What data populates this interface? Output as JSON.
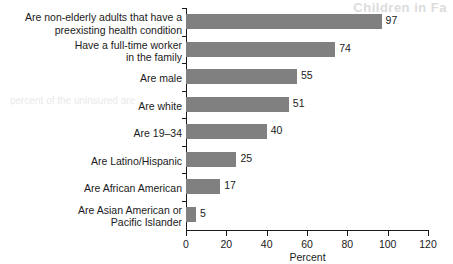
{
  "chart_data": {
    "type": "bar",
    "orientation": "horizontal",
    "title": "",
    "xlabel": "Percent",
    "ylabel": "",
    "xlim": [
      0,
      120
    ],
    "xticks": [
      0,
      20,
      40,
      60,
      80,
      100,
      120
    ],
    "grid": false,
    "legend": null,
    "bar_color": "#808080",
    "axis_color": "#1a1a1a",
    "categories": [
      "Are non-elderly adults that have a\npreexisting health condition",
      "Have a full-time worker\nin the family",
      "Are male",
      "Are white",
      "Are 19–34",
      "Are Latino/Hispanic",
      "Are African American",
      "Are Asian American or\nPacific Islander"
    ],
    "values": [
      97,
      74,
      55,
      51,
      40,
      25,
      17,
      5
    ],
    "value_labels": [
      "97",
      "74",
      "55",
      "51",
      "40",
      "25",
      "17",
      "5"
    ]
  },
  "artifacts": {
    "top_right_bleed": "Children in Fa",
    "mid_left_bleed": "percent of the uninsured are"
  }
}
